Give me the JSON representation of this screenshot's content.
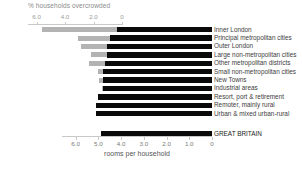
{
  "chart_data": {
    "type": "bar",
    "orientation": "horizontal",
    "layout": "back-to-back",
    "title": "",
    "top_axis": {
      "label": "% households overcrowded",
      "ticks": [
        "0",
        "2.0",
        "4.0",
        "6.0"
      ],
      "tick_values": [
        0,
        2.0,
        4.0,
        6.0
      ],
      "range": [
        0,
        6.6
      ],
      "direction": "left-to-right-decreasing-origin-right",
      "origin": "right"
    },
    "bottom_axis": {
      "label": "rooms per household",
      "ticks": [
        "6.0",
        "5.0",
        "4.0",
        "3.0",
        "2.0",
        "1.0",
        "0"
      ],
      "tick_values": [
        6.0,
        5.0,
        4.0,
        3.0,
        2.0,
        1.0,
        0
      ],
      "range": [
        0,
        6.6
      ],
      "direction": "reversed",
      "origin": "right"
    },
    "categories": [
      "Inner London",
      "Principal metropolitan cities",
      "Outer London",
      "Large non-metropolitan cities",
      "Other metropolitan districts",
      "Small non-metropolitan cities",
      "New Towns",
      "Industrial areas",
      "Resort, port & retirement",
      "Remoter, mainly rural",
      "Urban & mixed urban-rural"
    ],
    "total_category": "GREAT BRITAIN",
    "series": [
      {
        "name": "% households overcrowded",
        "axis": "top",
        "color": "#b3b3b3",
        "values": [
          5.6,
          3.1,
          2.9,
          2.2,
          2.3,
          1.7,
          1.6,
          1.4,
          1.1,
          0.9,
          0.8
        ],
        "total_value": 1.4
      },
      {
        "name": "rooms per household",
        "axis": "bottom",
        "color": "#0a0a0a",
        "values": [
          4.2,
          4.5,
          4.6,
          4.6,
          4.7,
          4.8,
          4.8,
          4.8,
          5.0,
          5.1,
          5.1
        ],
        "total_value": 4.9
      }
    ],
    "grid": false,
    "legend": "none"
  },
  "top_axis": {
    "label": "% households overcrowded",
    "ticks": [
      "0",
      "2.0",
      "4.0",
      "6.0"
    ]
  },
  "bottom_axis": {
    "label": "rooms per household",
    "ticks": [
      "6.0",
      "5.0",
      "4.0",
      "3.0",
      "2.0",
      "1.0",
      "0"
    ]
  },
  "rows": [
    {
      "label": "Inner London",
      "left": 5.6,
      "right": 4.2
    },
    {
      "label": "Principal metropolitan cities",
      "left": 3.1,
      "right": 4.5
    },
    {
      "label": "Outer London",
      "left": 2.9,
      "right": 4.6
    },
    {
      "label": "Large non-metropolitan cities",
      "left": 2.2,
      "right": 4.6
    },
    {
      "label": "Other metropolitan districts",
      "left": 2.3,
      "right": 4.7
    },
    {
      "label": "Small non-metropolitan cities",
      "left": 1.7,
      "right": 4.8
    },
    {
      "label": "New Towns",
      "left": 1.6,
      "right": 4.8
    },
    {
      "label": "Industrial areas",
      "left": 1.4,
      "right": 4.8
    },
    {
      "label": "Resort, port & retirement",
      "left": 1.1,
      "right": 5.0
    },
    {
      "label": "Remoter, mainly rural",
      "left": 0.9,
      "right": 5.1
    },
    {
      "label": "Urban & mixed urban-rural",
      "left": 0.8,
      "right": 5.1
    }
  ],
  "total_row": {
    "label": "GREAT BRITAIN",
    "left": 1.4,
    "right": 4.9
  },
  "colors": {
    "left_bar": "#b3b3b3",
    "right_bar": "#0a0a0a",
    "axis": "#c9c9c9",
    "text": "#3d3d3d",
    "muted_text": "#9a9a9a",
    "background": "#ffffff"
  }
}
